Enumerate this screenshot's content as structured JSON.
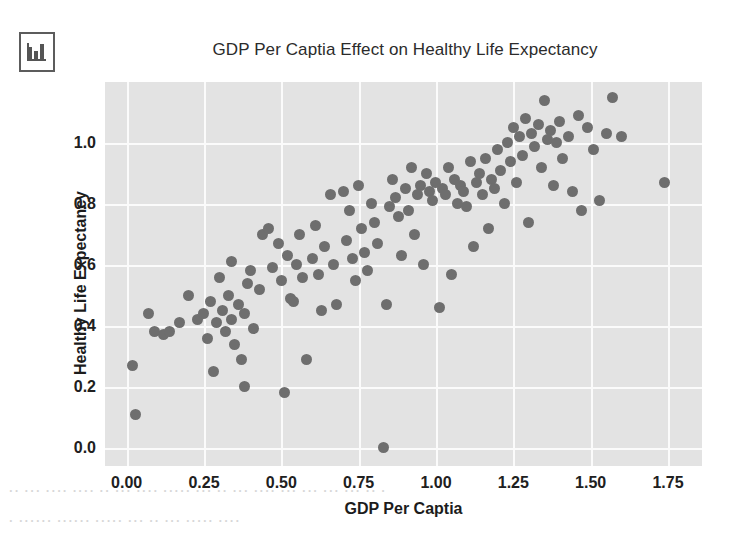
{
  "icon": {
    "name": "bar-chart-icon"
  },
  "chart_data": {
    "type": "scatter",
    "title": "GDP Per Captia Effect on Healthy Life Expectancy",
    "xlabel": "GDP Per Captia",
    "ylabel": "Healthy Life Expectancy",
    "xlim": [
      -0.07,
      1.86
    ],
    "ylim": [
      -0.06,
      1.2
    ],
    "xticks": [
      0.0,
      0.25,
      0.5,
      0.75,
      1.0,
      1.25,
      1.5,
      1.75
    ],
    "xticklabels": [
      "0.00",
      "0.25",
      "0.50",
      "0.75",
      "1.00",
      "1.25",
      "1.50",
      "1.75"
    ],
    "yticks": [
      0.0,
      0.2,
      0.4,
      0.6,
      0.8,
      1.0
    ],
    "yticklabels": [
      "0.0",
      "0.2",
      "0.4",
      "0.6",
      "0.8",
      "1.0"
    ],
    "grid": true,
    "legend": null,
    "marker_color": "#6e6e6e",
    "plot_background": "#e3e3e3",
    "grid_color": "#fbfbfb",
    "points": [
      [
        0.02,
        0.27
      ],
      [
        0.03,
        0.11
      ],
      [
        0.07,
        0.44
      ],
      [
        0.09,
        0.38
      ],
      [
        0.12,
        0.37
      ],
      [
        0.14,
        0.38
      ],
      [
        0.17,
        0.41
      ],
      [
        0.2,
        0.5
      ],
      [
        0.23,
        0.42
      ],
      [
        0.25,
        0.44
      ],
      [
        0.26,
        0.36
      ],
      [
        0.27,
        0.48
      ],
      [
        0.28,
        0.25
      ],
      [
        0.29,
        0.41
      ],
      [
        0.3,
        0.56
      ],
      [
        0.31,
        0.45
      ],
      [
        0.32,
        0.38
      ],
      [
        0.33,
        0.5
      ],
      [
        0.34,
        0.61
      ],
      [
        0.34,
        0.42
      ],
      [
        0.35,
        0.34
      ],
      [
        0.36,
        0.47
      ],
      [
        0.37,
        0.29
      ],
      [
        0.38,
        0.44
      ],
      [
        0.38,
        0.2
      ],
      [
        0.39,
        0.54
      ],
      [
        0.4,
        0.58
      ],
      [
        0.41,
        0.39
      ],
      [
        0.43,
        0.52
      ],
      [
        0.44,
        0.7
      ],
      [
        0.46,
        0.72
      ],
      [
        0.47,
        0.59
      ],
      [
        0.49,
        0.67
      ],
      [
        0.5,
        0.55
      ],
      [
        0.51,
        0.18
      ],
      [
        0.52,
        0.63
      ],
      [
        0.53,
        0.49
      ],
      [
        0.54,
        0.48
      ],
      [
        0.55,
        0.6
      ],
      [
        0.56,
        0.7
      ],
      [
        0.57,
        0.56
      ],
      [
        0.58,
        0.29
      ],
      [
        0.6,
        0.62
      ],
      [
        0.61,
        0.73
      ],
      [
        0.62,
        0.57
      ],
      [
        0.63,
        0.45
      ],
      [
        0.64,
        0.66
      ],
      [
        0.66,
        0.83
      ],
      [
        0.67,
        0.6
      ],
      [
        0.68,
        0.47
      ],
      [
        0.7,
        0.84
      ],
      [
        0.71,
        0.68
      ],
      [
        0.72,
        0.78
      ],
      [
        0.73,
        0.62
      ],
      [
        0.74,
        0.55
      ],
      [
        0.75,
        0.86
      ],
      [
        0.76,
        0.72
      ],
      [
        0.77,
        0.64
      ],
      [
        0.78,
        0.58
      ],
      [
        0.79,
        0.8
      ],
      [
        0.8,
        0.74
      ],
      [
        0.81,
        0.67
      ],
      [
        0.83,
        0.0
      ],
      [
        0.84,
        0.47
      ],
      [
        0.85,
        0.79
      ],
      [
        0.86,
        0.88
      ],
      [
        0.87,
        0.82
      ],
      [
        0.88,
        0.76
      ],
      [
        0.89,
        0.63
      ],
      [
        0.9,
        0.85
      ],
      [
        0.91,
        0.78
      ],
      [
        0.92,
        0.92
      ],
      [
        0.93,
        0.7
      ],
      [
        0.94,
        0.83
      ],
      [
        0.95,
        0.86
      ],
      [
        0.96,
        0.6
      ],
      [
        0.97,
        0.9
      ],
      [
        0.98,
        0.84
      ],
      [
        0.99,
        0.81
      ],
      [
        1.0,
        0.87
      ],
      [
        1.01,
        0.46
      ],
      [
        1.02,
        0.85
      ],
      [
        1.03,
        0.83
      ],
      [
        1.04,
        0.92
      ],
      [
        1.05,
        0.57
      ],
      [
        1.06,
        0.88
      ],
      [
        1.07,
        0.8
      ],
      [
        1.08,
        0.86
      ],
      [
        1.09,
        0.84
      ],
      [
        1.1,
        0.79
      ],
      [
        1.11,
        0.94
      ],
      [
        1.12,
        0.66
      ],
      [
        1.13,
        0.87
      ],
      [
        1.14,
        0.9
      ],
      [
        1.15,
        0.83
      ],
      [
        1.16,
        0.95
      ],
      [
        1.17,
        0.72
      ],
      [
        1.18,
        0.88
      ],
      [
        1.19,
        0.85
      ],
      [
        1.2,
        0.98
      ],
      [
        1.21,
        0.91
      ],
      [
        1.22,
        0.8
      ],
      [
        1.23,
        1.0
      ],
      [
        1.24,
        0.94
      ],
      [
        1.25,
        1.05
      ],
      [
        1.26,
        0.87
      ],
      [
        1.27,
        1.02
      ],
      [
        1.28,
        0.96
      ],
      [
        1.29,
        1.08
      ],
      [
        1.3,
        0.74
      ],
      [
        1.31,
        1.03
      ],
      [
        1.32,
        0.99
      ],
      [
        1.33,
        1.06
      ],
      [
        1.34,
        0.92
      ],
      [
        1.35,
        1.14
      ],
      [
        1.36,
        1.01
      ],
      [
        1.37,
        1.04
      ],
      [
        1.38,
        0.86
      ],
      [
        1.39,
        1.0
      ],
      [
        1.4,
        1.07
      ],
      [
        1.41,
        0.95
      ],
      [
        1.43,
        1.02
      ],
      [
        1.44,
        0.84
      ],
      [
        1.46,
        1.09
      ],
      [
        1.47,
        0.78
      ],
      [
        1.49,
        1.05
      ],
      [
        1.51,
        0.98
      ],
      [
        1.53,
        0.81
      ],
      [
        1.55,
        1.03
      ],
      [
        1.57,
        1.15
      ],
      [
        1.6,
        1.02
      ],
      [
        1.74,
        0.87
      ]
    ]
  },
  "bleed_text": {
    "line1": "· ·· ···· ··· ···· ····· ···· ·· ·····",
    "line2": "·· ··· ···· ···· ·· ··· ···· ····· ··· ·· ··· ···· ··· ··· ··· ··· ·· ·",
    "line3": "· ······ ······ ····· ··· ·· ··· ····· ····"
  }
}
